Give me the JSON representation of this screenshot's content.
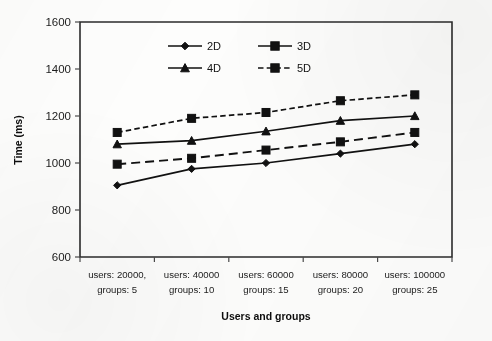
{
  "chart_data": {
    "type": "line",
    "title": "",
    "xlabel": "Users and groups",
    "ylabel": "Time (ms)",
    "ylim": [
      600,
      1600
    ],
    "ytick_step": 200,
    "yticks": [
      600,
      800,
      1000,
      1200,
      1400,
      1600
    ],
    "grid": false,
    "legend_position": "top-center-inside",
    "categories": [
      "users: 20000,\ngroups: 5",
      "users: 40000\ngroups: 10",
      "users: 60000\ngroups: 15",
      "users: 80000\ngroups: 20",
      "users: 100000\ngroups: 25"
    ],
    "category_lines": [
      [
        "users: 20000,",
        "groups: 5"
      ],
      [
        "users: 40000",
        "groups: 10"
      ],
      [
        "users: 60000",
        "groups: 15"
      ],
      [
        "users: 80000",
        "groups: 20"
      ],
      [
        "users: 100000",
        "groups: 25"
      ]
    ],
    "series": [
      {
        "name": "2D",
        "marker": "diamond",
        "linestyle": "solid",
        "color": "#111111",
        "values": [
          905,
          975,
          1000,
          1040,
          1080
        ]
      },
      {
        "name": "3D",
        "marker": "square",
        "linestyle": "longdash",
        "color": "#111111",
        "values": [
          995,
          1020,
          1055,
          1090,
          1130
        ]
      },
      {
        "name": "4D",
        "marker": "triangle",
        "linestyle": "solid",
        "color": "#111111",
        "values": [
          1080,
          1095,
          1135,
          1180,
          1200
        ]
      },
      {
        "name": "5D",
        "marker": "square",
        "linestyle": "dashed",
        "color": "#111111",
        "values": [
          1130,
          1190,
          1215,
          1265,
          1290
        ]
      }
    ]
  },
  "legend": {
    "entries": [
      {
        "label": "2D",
        "marker": "diamond",
        "linestyle": "solid"
      },
      {
        "label": "3D",
        "marker": "square",
        "linestyle": "solid"
      },
      {
        "label": "4D",
        "marker": "triangle",
        "linestyle": "solid"
      },
      {
        "label": "5D",
        "marker": "square",
        "linestyle": "dashed"
      }
    ]
  },
  "axes": {
    "y_title": "Time (ms)",
    "x_title": "Users and groups",
    "y_labels": [
      "1600",
      "1400",
      "1200",
      "1000",
      "800",
      "600"
    ]
  },
  "colors": {
    "ink": "#111111",
    "axis": "#2b2b2b",
    "background": "#fdfdfc"
  }
}
